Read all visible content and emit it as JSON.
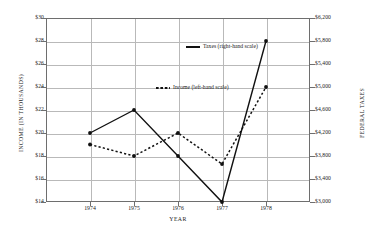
{
  "chart_data": {
    "type": "line",
    "title": "",
    "xlabel": "YEAR",
    "ylabel": "INCOME (IN THOUSANDS)",
    "y2label": "FEDERAL TAXES",
    "categories": [
      "1974",
      "1975",
      "1976",
      "1977",
      "1978"
    ],
    "grid": true,
    "legend_position": "inside-center",
    "ylim": [
      14,
      30
    ],
    "y2lim": [
      3000,
      6200
    ],
    "yticks": [
      "$14",
      "$16",
      "$18",
      "$20",
      "$22",
      "$24",
      "$26",
      "$28",
      "$30"
    ],
    "ytick_values": [
      14,
      16,
      18,
      20,
      22,
      24,
      26,
      28,
      30
    ],
    "y2ticks": [
      "$3,000",
      "$3,400",
      "$3,800",
      "$4,200",
      "$4,600",
      "$5,000",
      "$5,400",
      "$5,800",
      "$6,200"
    ],
    "y2tick_values": [
      3000,
      3400,
      3800,
      4200,
      4600,
      5000,
      5400,
      5800,
      6200
    ],
    "series": [
      {
        "name": "Taxes (right-hand scale)",
        "axis": "right",
        "style": "solid",
        "color": "#111111",
        "marker": "circle",
        "values": [
          4200,
          4600,
          3800,
          3000,
          5800
        ]
      },
      {
        "name": "Income (left-hand scale)",
        "axis": "left",
        "style": "dotted",
        "color": "#111111",
        "marker": "circle",
        "values": [
          19.0,
          18.0,
          20.0,
          17.3,
          24.0
        ]
      }
    ]
  },
  "legend": {
    "taxes_label": "Taxes (right-hand scale)",
    "income_label": "Income (left-hand scale)"
  }
}
